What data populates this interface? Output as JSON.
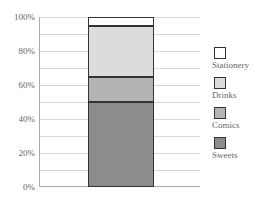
{
  "chart_data": {
    "type": "bar",
    "stacked": true,
    "categories": [
      ""
    ],
    "series": [
      {
        "name": "Sweets",
        "values": [
          50
        ],
        "color": "#8c8c8c"
      },
      {
        "name": "Comics",
        "values": [
          15
        ],
        "color": "#b4b4b4"
      },
      {
        "name": "Drinks",
        "values": [
          30
        ],
        "color": "#dcdcdc"
      },
      {
        "name": "Stationery",
        "values": [
          5
        ],
        "color": "#ffffff"
      }
    ],
    "title": "",
    "xlabel": "",
    "ylabel": "",
    "ylim": [
      0,
      100
    ],
    "yticks": [
      "0%",
      "20%",
      "40%",
      "60%",
      "80%",
      "100%"
    ],
    "grid": true,
    "legend_position": "right"
  },
  "axis": {
    "ticks": [
      "0%",
      "20%",
      "40%",
      "60%",
      "80%",
      "100%"
    ]
  },
  "legend": {
    "items": [
      {
        "label": "Stationery",
        "color": "#ffffff"
      },
      {
        "label": "Drinks",
        "color": "#dcdcdc"
      },
      {
        "label": "Comics",
        "color": "#b4b4b4"
      },
      {
        "label": "Sweets",
        "color": "#8c8c8c"
      }
    ]
  }
}
